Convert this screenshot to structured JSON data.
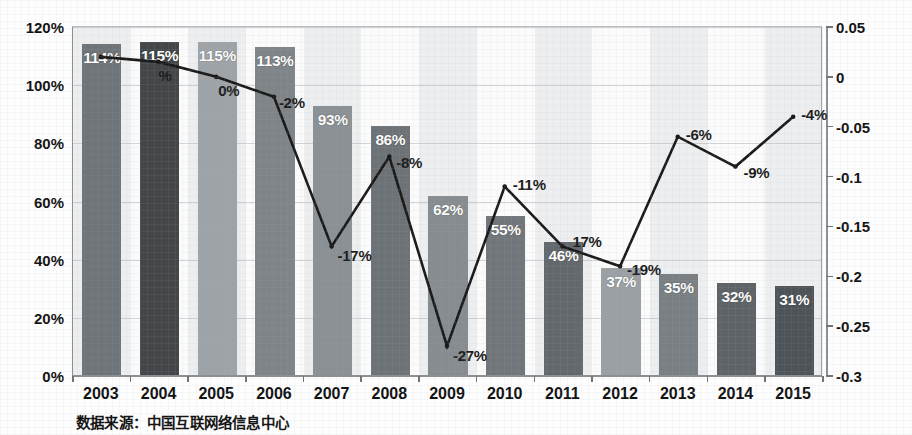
{
  "chart_data": {
    "type": "bar",
    "title": "",
    "subtitle": "",
    "xlabel": "",
    "ylabel": "",
    "categories": [
      "2003",
      "2004",
      "2005",
      "2006",
      "2007",
      "2008",
      "2009",
      "2010",
      "2011",
      "2012",
      "2013",
      "2014",
      "2015"
    ],
    "series": [
      {
        "name": "bar-series",
        "axis": "left",
        "type": "bar",
        "values": [
          114,
          115,
          115,
          113,
          93,
          86,
          62,
          55,
          46,
          37,
          35,
          32,
          31
        ],
        "value_labels": [
          "114%",
          "115%",
          "115%",
          "113%",
          "93%",
          "86%",
          "62%",
          "55%",
          "46%",
          "37%",
          "35%",
          "32%",
          "31%"
        ],
        "bar_colors": [
          "#6f7478",
          "#434749",
          "#9ea3a7",
          "#7f8488",
          "#8b9094",
          "#6d7276",
          "#878c90",
          "#71767a",
          "#63686c",
          "#9aa0a4",
          "#7a7f83",
          "#5e6367",
          "#4e5357"
        ]
      },
      {
        "name": "line-series",
        "axis": "right",
        "type": "line",
        "values": [
          0.02,
          0.015,
          0.0,
          -0.02,
          -0.17,
          -0.08,
          -0.27,
          -0.11,
          -0.17,
          -0.19,
          -0.06,
          -0.09,
          -0.04
        ],
        "value_labels": [
          "",
          "%",
          "0%",
          "-2%",
          "-17%",
          "-8%",
          "-27%",
          "-11%",
          "17%",
          "-19%",
          "-6%",
          "-9%",
          "-4%"
        ],
        "line_color": "#1a1a1a"
      }
    ],
    "left_axis": {
      "ticks": [
        "0%",
        "20%",
        "40%",
        "60%",
        "80%",
        "100%",
        "120%"
      ],
      "min": 0,
      "max": 120,
      "format": "percent"
    },
    "right_axis": {
      "ticks": [
        "-0.3",
        "-0.25",
        "-0.2",
        "-0.15",
        "-0.1",
        "-0.05",
        "0",
        "0.05"
      ],
      "min": -0.3,
      "max": 0.05,
      "format": "decimal"
    },
    "grid": true,
    "legend": "none"
  },
  "source_note": "数据来源：中国互联网络信息中心"
}
